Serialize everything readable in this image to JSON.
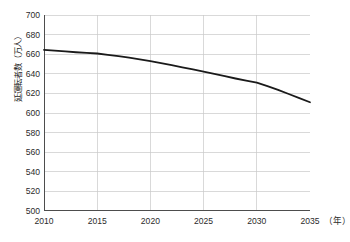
{
  "chart_data": {
    "type": "line",
    "title": "",
    "subtitle": "",
    "xlabel": "年",
    "ylabel": "延運転者数（万人）",
    "x_unit_label": "（年）",
    "x": [
      2010,
      2011,
      2012,
      2013,
      2014,
      2015,
      2016,
      2017,
      2018,
      2019,
      2020,
      2021,
      2022,
      2023,
      2024,
      2025,
      2026,
      2027,
      2028,
      2029,
      2030,
      2031,
      2032,
      2033,
      2034,
      2035
    ],
    "series": [
      {
        "name": "延運転者数",
        "values": [
          664.5,
          663.6,
          662.8,
          662.0,
          661.4,
          660.7,
          659.4,
          658.0,
          656.4,
          654.8,
          653.0,
          651.0,
          648.8,
          646.6,
          644.4,
          642.2,
          640.0,
          637.6,
          635.2,
          633.0,
          631.0,
          627.4,
          623.6,
          619.4,
          615.2,
          611.0
        ],
        "color": "#1a1a1a",
        "line_width": 1.8
      }
    ],
    "xlim": [
      2010,
      2035
    ],
    "ylim": [
      500,
      700
    ],
    "xticks": [
      2010,
      2015,
      2020,
      2025,
      2030,
      2035
    ],
    "xtick_labels": [
      "2010",
      "2015",
      "2020",
      "2025",
      "2030",
      "2035"
    ],
    "yticks": [
      500,
      520,
      540,
      560,
      580,
      600,
      620,
      640,
      660,
      680,
      700
    ],
    "ytick_labels": [
      "500",
      "520",
      "540",
      "560",
      "580",
      "600",
      "620",
      "640",
      "660",
      "680",
      "700"
    ],
    "grid": true,
    "grid_color": "#c9c9c9",
    "axis_color": "#4d4d4d",
    "legend": false,
    "legend_position": "none",
    "background": "#ffffff",
    "annotations": []
  }
}
